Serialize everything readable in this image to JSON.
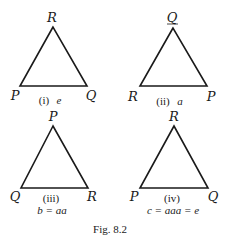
{
  "figure": {
    "caption": "Fig. 8.2",
    "stroke_color": "#1a1a1a",
    "background": "#ffffff"
  },
  "triangles": [
    {
      "id": "i",
      "vertices": {
        "top": "R",
        "left": "P",
        "right": "Q"
      },
      "numeral": "(i)",
      "label": "e",
      "equation": ""
    },
    {
      "id": "ii",
      "vertices": {
        "top": "Q",
        "left": "R",
        "right": "P"
      },
      "numeral": "(ii)",
      "label": "a",
      "equation": ""
    },
    {
      "id": "iii",
      "vertices": {
        "top": "P",
        "left": "Q",
        "right": "R"
      },
      "numeral": "(iii)",
      "label": "",
      "equation": "b = aa"
    },
    {
      "id": "iv",
      "vertices": {
        "top": "R",
        "left": "P",
        "right": "Q"
      },
      "numeral": "(iv)",
      "label": "",
      "equation": "c = aaa = e"
    }
  ]
}
